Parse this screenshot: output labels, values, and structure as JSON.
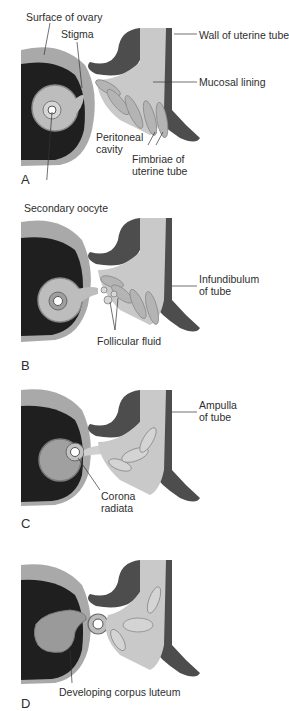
{
  "figure": {
    "colors": {
      "ovary_surface": "#a9a9a9",
      "ovary_interior": "#1f1f1f",
      "follicle": "#bdbdbd",
      "tube_wall": "#4d4d4d",
      "mucosa": "#c9c9c9",
      "fimbriae": "#b4b4b4",
      "background": "#ffffff"
    },
    "panels": [
      {
        "letter": "A",
        "labels": {
          "surface_of_ovary": "Surface of ovary",
          "stigma": "Stigma",
          "wall_of_uterine_tube": "Wall of uterine tube",
          "mucosal_lining": "Mucosal lining",
          "peritoneal_cavity_1": "Peritoneal",
          "peritoneal_cavity_2": "cavity",
          "fimbriae_1": "Fimbriae of",
          "fimbriae_2": "uterine tube"
        }
      },
      {
        "letter": "B",
        "labels": {
          "secondary_oocyte": "Secondary oocyte",
          "infundibulum_1": "Infundibulum",
          "infundibulum_2": "of tube",
          "follicular_fluid": "Follicular fluid"
        }
      },
      {
        "letter": "C",
        "labels": {
          "ampulla_1": "Ampulla",
          "ampulla_2": "of tube",
          "corona_1": "Corona",
          "corona_2": "radiata"
        }
      },
      {
        "letter": "D",
        "labels": {
          "corpus_luteum": "Developing corpus luteum"
        }
      }
    ]
  }
}
